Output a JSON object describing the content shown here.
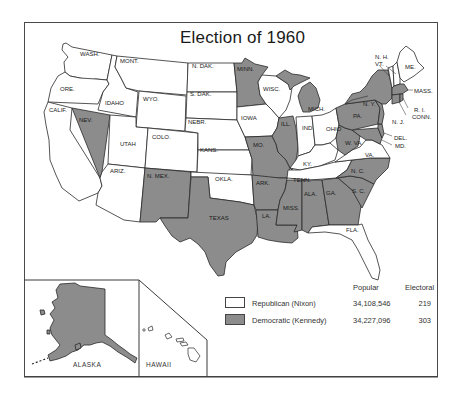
{
  "title": "Election of 1960",
  "colors": {
    "republican_fill": "#ffffff",
    "democratic_fill": "#8c8c8c",
    "border": "#2a2a2a"
  },
  "legend": {
    "header_popular": "Popular",
    "header_electoral": "Electoral",
    "rows": [
      {
        "party": "Republican (Nixon)",
        "popular": "34,108,546",
        "electoral": "219",
        "fill": "white"
      },
      {
        "party": "Democratic (Kennedy)",
        "popular": "34,227,096",
        "electoral": "303",
        "fill": "gray"
      }
    ]
  },
  "states": {
    "wash": {
      "label": "WASH.",
      "winner": "R"
    },
    "ore": {
      "label": "ORE.",
      "winner": "R"
    },
    "calif": {
      "label": "CALIF.",
      "winner": "R"
    },
    "nev": {
      "label": "NEV.",
      "winner": "D"
    },
    "idaho": {
      "label": "IDAHO",
      "winner": "R"
    },
    "mont": {
      "label": "MONT.",
      "winner": "R"
    },
    "wyo": {
      "label": "WYO.",
      "winner": "R"
    },
    "utah": {
      "label": "UTAH",
      "winner": "R"
    },
    "colo": {
      "label": "COLO.",
      "winner": "R"
    },
    "ariz": {
      "label": "ARIZ.",
      "winner": "R"
    },
    "nmex": {
      "label": "N. MEX.",
      "winner": "D"
    },
    "ndak": {
      "label": "N. DAK.",
      "winner": "R"
    },
    "sdak": {
      "label": "S. DAK.",
      "winner": "R"
    },
    "nebr": {
      "label": "NEBR.",
      "winner": "R"
    },
    "kans": {
      "label": "KANS.",
      "winner": "R"
    },
    "okla": {
      "label": "OKLA.",
      "winner": "R"
    },
    "texas": {
      "label": "TEXAS",
      "winner": "D"
    },
    "minn": {
      "label": "MINN.",
      "winner": "D"
    },
    "iowa": {
      "label": "IOWA",
      "winner": "R"
    },
    "mo": {
      "label": "MO.",
      "winner": "D"
    },
    "ark": {
      "label": "ARK.",
      "winner": "D"
    },
    "la": {
      "label": "LA.",
      "winner": "D"
    },
    "wisc": {
      "label": "WISC.",
      "winner": "R"
    },
    "ill": {
      "label": "ILL.",
      "winner": "D"
    },
    "mich": {
      "label": "MICH.",
      "winner": "D"
    },
    "ind": {
      "label": "IND.",
      "winner": "R"
    },
    "ohio": {
      "label": "OHIO",
      "winner": "R"
    },
    "ky": {
      "label": "KY.",
      "winner": "R"
    },
    "tenn": {
      "label": "TENN.",
      "winner": "R"
    },
    "miss": {
      "label": "MISS.",
      "winner": "D"
    },
    "ala": {
      "label": "ALA.",
      "winner": "D"
    },
    "ga": {
      "label": "GA.",
      "winner": "D"
    },
    "fla": {
      "label": "FLA.",
      "winner": "R"
    },
    "sc": {
      "label": "S. C.",
      "winner": "D"
    },
    "nc": {
      "label": "N. C.",
      "winner": "D"
    },
    "va": {
      "label": "VA.",
      "winner": "R"
    },
    "wva": {
      "label": "W. VA.",
      "winner": "D"
    },
    "md": {
      "label": "MD.",
      "winner": "D"
    },
    "del": {
      "label": "DEL.",
      "winner": "D"
    },
    "nj": {
      "label": "N. J.",
      "winner": "D"
    },
    "pa": {
      "label": "PA.",
      "winner": "D"
    },
    "ny": {
      "label": "N. Y.",
      "winner": "D"
    },
    "conn": {
      "label": "CONN.",
      "winner": "D"
    },
    "ri": {
      "label": "R. I.",
      "winner": "D"
    },
    "mass": {
      "label": "MASS.",
      "winner": "D"
    },
    "vt": {
      "label": "VT.",
      "winner": "R"
    },
    "nh": {
      "label": "N. H.",
      "winner": "R"
    },
    "me": {
      "label": "ME.",
      "winner": "R"
    },
    "alaska": {
      "label": "ALASKA",
      "winner": "D"
    },
    "hawaii": {
      "label": "HAWAII",
      "winner": "D"
    }
  }
}
